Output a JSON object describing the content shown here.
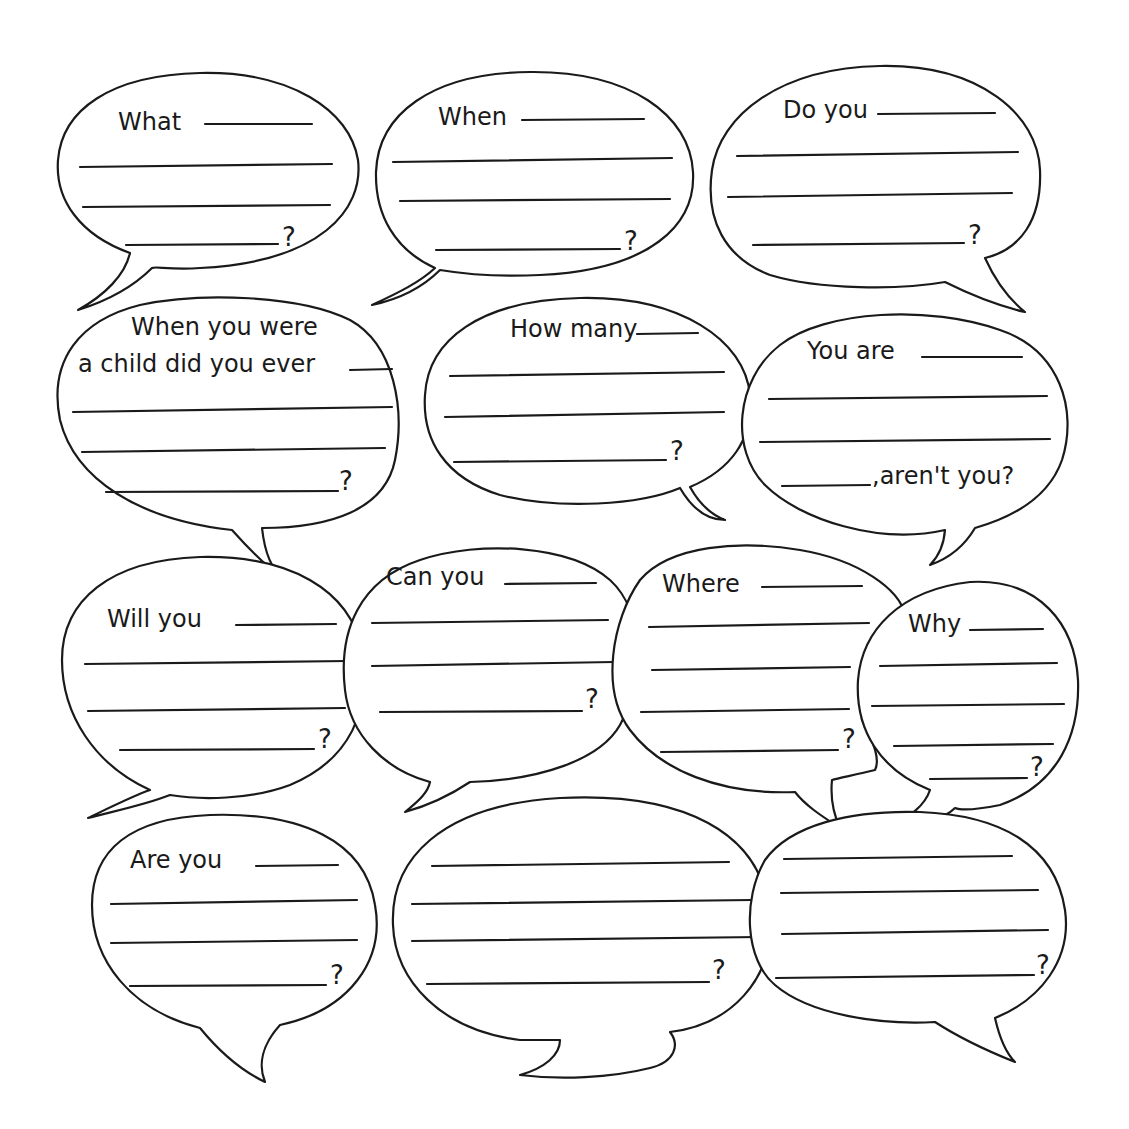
{
  "worksheet": {
    "background": "#ffffff",
    "ink": "#1a1a1a",
    "bubbles": [
      {
        "id": "what",
        "prompt": "What",
        "ending": "?",
        "answer_lines": 4
      },
      {
        "id": "when",
        "prompt": "When",
        "ending": "?",
        "answer_lines": 4
      },
      {
        "id": "do-you",
        "prompt": "Do you",
        "ending": "?",
        "answer_lines": 4
      },
      {
        "id": "when-child",
        "prompt": "When you were",
        "prompt_line2": "a child did you ever",
        "ending": "?",
        "answer_lines": 4
      },
      {
        "id": "how-many",
        "prompt": "How many",
        "ending": "?",
        "answer_lines": 4
      },
      {
        "id": "you-are",
        "prompt": "You are",
        "ending": ",aren't you?",
        "answer_lines": 4
      },
      {
        "id": "will-you",
        "prompt": "Will you",
        "ending": "?",
        "answer_lines": 4
      },
      {
        "id": "can-you",
        "prompt": "Can you",
        "ending": "?",
        "answer_lines": 4
      },
      {
        "id": "where",
        "prompt": "Where",
        "ending": "?",
        "answer_lines": 5
      },
      {
        "id": "why",
        "prompt": "Why",
        "ending": "?",
        "answer_lines": 5
      },
      {
        "id": "are-you",
        "prompt": "Are you",
        "ending": "?",
        "answer_lines": 4
      },
      {
        "id": "blank-1",
        "prompt": "",
        "ending": "?",
        "answer_lines": 4
      },
      {
        "id": "blank-2",
        "prompt": "",
        "ending": "?",
        "answer_lines": 4
      }
    ]
  }
}
